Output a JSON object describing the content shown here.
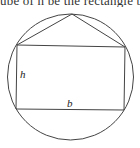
{
  "caption_fragment": "ube of h be the rectangle b",
  "figure": {
    "circle": {
      "cx": 70.5,
      "cy": 77,
      "r": 63
    },
    "rectangle": {
      "top_left": [
        17,
        45
      ],
      "top_right": [
        125,
        47
      ],
      "bottom_right": [
        124,
        110
      ],
      "bottom_left": [
        16,
        109
      ]
    },
    "apex": [
      72,
      14
    ],
    "labels": {
      "height": "h",
      "base": "b"
    },
    "stroke_color": "#444444"
  }
}
